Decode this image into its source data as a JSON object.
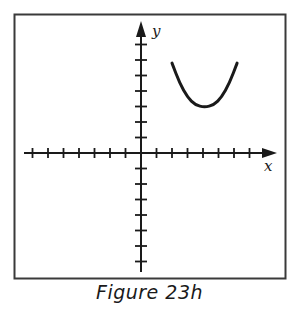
{
  "figure": {
    "caption": "Figure 23h",
    "colors": {
      "ink": "#1a1a1a",
      "frame": "#3a3a3a",
      "background": "#ffffff"
    }
  },
  "chart_data": {
    "type": "line",
    "title": "",
    "caption": "Figure 23h",
    "xlabel": "x",
    "ylabel": "y",
    "grid": false,
    "axes": {
      "x_ticks_negative": 7,
      "x_ticks_positive": 7,
      "y_ticks_positive": 7,
      "y_ticks_negative": 7,
      "xlim": [
        -7.5,
        8.5
      ],
      "ylim": [
        -7.5,
        8.5
      ]
    },
    "series": [
      {
        "name": "parabola (opens upward)",
        "x": [
          2.0,
          2.5,
          3.0,
          3.5,
          4.1,
          4.7,
          5.2,
          5.7,
          6.2
        ],
        "y": [
          5.8,
          4.5,
          3.6,
          3.1,
          2.95,
          3.1,
          3.6,
          4.5,
          5.8
        ]
      }
    ]
  }
}
